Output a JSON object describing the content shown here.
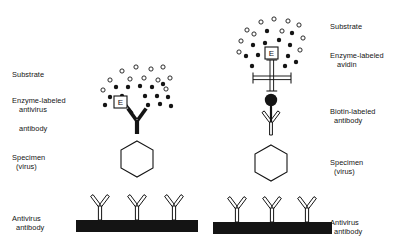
{
  "figure": {
    "type": "scientific-diagram",
    "background_color": "#ffffff",
    "ink_color": "#141414"
  },
  "left_panel": {
    "name": "direct-enzyme-labeled-antibody-assay",
    "labels": {
      "substrate": "Substrate",
      "enzyme_antibody_line1": "Enzyme-labeled",
      "enzyme_antibody_line2": "antivirus",
      "enzyme_antibody_line3": "antibody",
      "specimen_line1": "Specimen",
      "specimen_line2": "(virus)",
      "capture_line1": "Antivirus",
      "capture_line2": "antibody"
    },
    "enzyme_box_letter": "E",
    "substrate_cloud": {
      "hollow_circle_count": 11,
      "filled_dot_count": 14
    },
    "capture_antibody_count": 3,
    "specimen_shape": "hexagon"
  },
  "right_panel": {
    "name": "biotin-avidin-amplified-assay",
    "labels": {
      "substrate": "Substrate",
      "enzyme_avidin_line1": "Enzyme-labeled",
      "enzyme_avidin_line2": "avidin",
      "biotin_antibody_line1": "Biotin-labeled",
      "biotin_antibody_line2": "antibody",
      "specimen_line1": "Specimen",
      "specimen_line2": "(virus)",
      "capture_line1": "Antivirus",
      "capture_line2": "antibody"
    },
    "enzyme_box_letter": "E",
    "substrate_cloud": {
      "hollow_circle_count": 11,
      "filled_dot_count": 13
    },
    "avidin_shape": "cross",
    "biotin_marker_shape": "filled-circle",
    "capture_antibody_count": 3,
    "specimen_shape": "hexagon"
  }
}
